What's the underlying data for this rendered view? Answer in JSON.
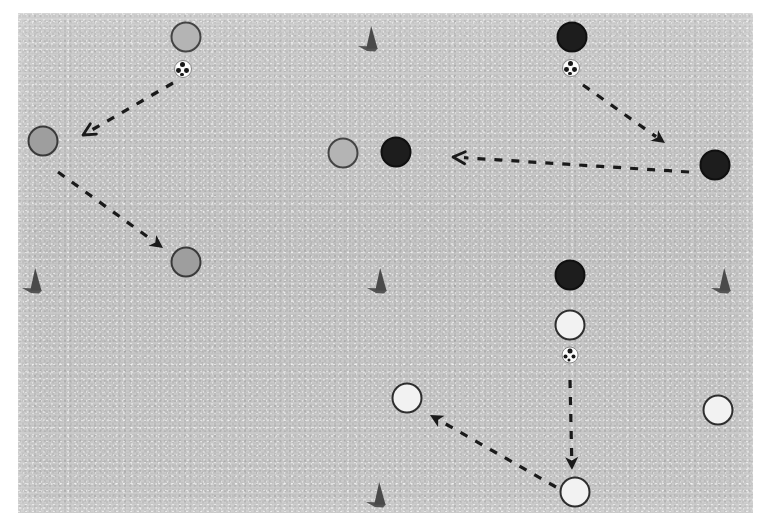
{
  "scene": {
    "title": "Soccer training drill diagram",
    "canvas": {
      "width": 764,
      "height": 523
    },
    "pitch": {
      "name": "training-grid",
      "x": 18,
      "y": 13,
      "width": 735,
      "height": 500,
      "fill_color": "#c8c8c8"
    },
    "legend_colors": {
      "grey_team": "#9e9e9e",
      "grey_light_team": "#b4b4b4",
      "dark_team": "#1d1d1d",
      "white_team": "#f2f2f2",
      "outline": "#2e2e2e",
      "arrow": "#1a1a1a",
      "cone": "#4a4a4a",
      "ball_white": "#fbfbfb",
      "ball_patch": "#171717"
    }
  },
  "players": [
    {
      "id": "grey-top",
      "team": "grey-light",
      "x": 186,
      "y": 37,
      "d": 31
    },
    {
      "id": "grey-left",
      "team": "grey",
      "x": 43,
      "y": 141,
      "d": 31
    },
    {
      "id": "grey-mid-left",
      "team": "grey",
      "x": 186,
      "y": 262,
      "d": 31
    },
    {
      "id": "grey-center",
      "team": "grey-light",
      "x": 343,
      "y": 153,
      "d": 31
    },
    {
      "id": "dark-center",
      "team": "dark",
      "x": 396,
      "y": 152,
      "d": 31
    },
    {
      "id": "dark-top",
      "team": "dark",
      "x": 572,
      "y": 37,
      "d": 31
    },
    {
      "id": "dark-right",
      "team": "dark",
      "x": 715,
      "y": 165,
      "d": 31
    },
    {
      "id": "dark-lower-center",
      "team": "dark",
      "x": 570,
      "y": 275,
      "d": 31
    },
    {
      "id": "white-upper",
      "team": "white",
      "x": 570,
      "y": 325,
      "d": 31
    },
    {
      "id": "white-left",
      "team": "white",
      "x": 407,
      "y": 398,
      "d": 31
    },
    {
      "id": "white-right",
      "team": "white",
      "x": 718,
      "y": 410,
      "d": 31
    },
    {
      "id": "white-bottom",
      "team": "white",
      "x": 575,
      "y": 492,
      "d": 31
    }
  ],
  "balls": [
    {
      "id": "ball-top-left",
      "x": 183,
      "y": 69,
      "d": 18
    },
    {
      "id": "ball-top-right",
      "x": 571,
      "y": 68,
      "d": 18
    },
    {
      "id": "ball-bottom-mid",
      "x": 570,
      "y": 355,
      "d": 17
    }
  ],
  "cones": [
    {
      "id": "cone-top-center",
      "x": 369,
      "y": 39
    },
    {
      "id": "cone-left-mid",
      "x": 33,
      "y": 281
    },
    {
      "id": "cone-center-mid",
      "x": 378,
      "y": 281
    },
    {
      "id": "cone-right-mid",
      "x": 722,
      "y": 281
    },
    {
      "id": "cone-bottom-center",
      "x": 377,
      "y": 495
    }
  ],
  "arrows": [
    {
      "id": "pass-grey-top-to-grey-left",
      "from": {
        "x": 173,
        "y": 83
      },
      "to": {
        "x": 83,
        "y": 135
      },
      "head": "thin"
    },
    {
      "id": "run-grey-left-to-grey-mid-left",
      "from": {
        "x": 58,
        "y": 172
      },
      "to": {
        "x": 163,
        "y": 248
      },
      "head": "solid"
    },
    {
      "id": "pass-dark-top-to-dark-right",
      "from": {
        "x": 583,
        "y": 85
      },
      "to": {
        "x": 665,
        "y": 143
      },
      "head": "solid"
    },
    {
      "id": "pass-dark-right-to-dark-center",
      "from": {
        "x": 689,
        "y": 172
      },
      "to": {
        "x": 453,
        "y": 157
      },
      "head": "thin"
    },
    {
      "id": "dribble-ball-to-white-bottom",
      "from": {
        "x": 570,
        "y": 380
      },
      "to": {
        "x": 572,
        "y": 470
      },
      "head": "solid"
    },
    {
      "id": "run-white-bottom-to-white-left",
      "from": {
        "x": 556,
        "y": 487
      },
      "to": {
        "x": 430,
        "y": 415
      },
      "head": "solid"
    }
  ]
}
